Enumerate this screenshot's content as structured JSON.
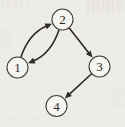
{
  "figure": {
    "type": "directed-graph",
    "canvas": {
      "width": 125,
      "height": 127
    },
    "colors": {
      "paper": "#eeece8",
      "ink": "#2d2a27",
      "node_fill": "#f6f5f2",
      "node_stroke": "#403d39"
    },
    "nodes": [
      {
        "id": "1",
        "label": "1",
        "x": 17.5,
        "y": 67.5,
        "r": 10.5
      },
      {
        "id": "2",
        "label": "2",
        "x": 62.5,
        "y": 19.5,
        "r": 10.5
      },
      {
        "id": "3",
        "label": "3",
        "x": 99.5,
        "y": 66.5,
        "r": 10.5
      },
      {
        "id": "4",
        "label": "4",
        "x": 56.5,
        "y": 106,
        "r": 10.5
      }
    ],
    "edges": [
      {
        "from": "1",
        "to": "2",
        "bow": 15
      },
      {
        "from": "2",
        "to": "1",
        "bow": 15
      },
      {
        "from": "2",
        "to": "3",
        "bow": 0
      },
      {
        "from": "3",
        "to": "4",
        "bow": 0
      }
    ]
  }
}
